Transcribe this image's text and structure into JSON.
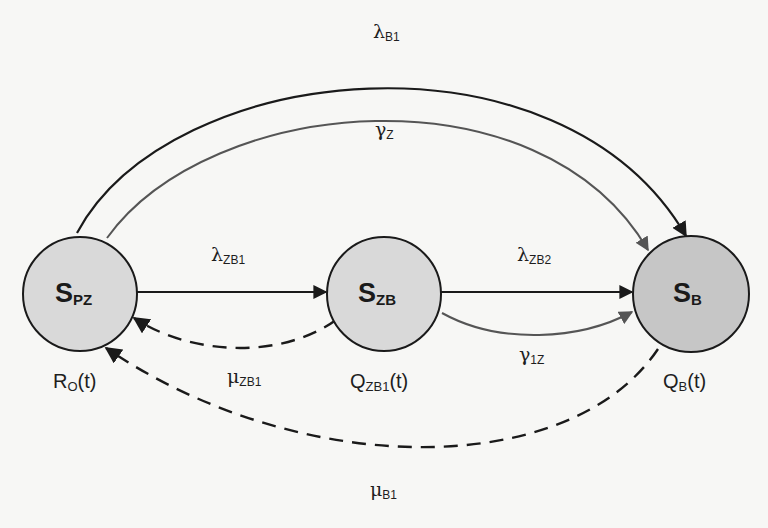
{
  "diagram": {
    "type": "state-transition",
    "nodes": [
      {
        "id": "S_PZ",
        "label_main": "S",
        "label_sub": "PZ",
        "function_main": "R",
        "function_sub": "O",
        "function_arg": "(t)",
        "fill": "#d9d9d9"
      },
      {
        "id": "S_ZB",
        "label_main": "S",
        "label_sub": "ZB",
        "function_main": "Q",
        "function_sub": "ZB1",
        "function_arg": "(t)",
        "fill": "#d9d9d9"
      },
      {
        "id": "S_B",
        "label_main": "S",
        "label_sub": "B",
        "function_main": "Q",
        "function_sub": "B",
        "function_arg": "(t)",
        "fill": "#c6c6c6"
      }
    ],
    "edges": [
      {
        "id": "lambda_B1",
        "from": "S_PZ",
        "to": "S_B",
        "style": "solid",
        "color": "#1a1a1a",
        "symbol": "λ",
        "sub": "B1"
      },
      {
        "id": "gamma_Z",
        "from": "S_PZ",
        "to": "S_B",
        "style": "solid",
        "color": "#555555",
        "symbol": "γ",
        "sub": "Z"
      },
      {
        "id": "lambda_ZB1",
        "from": "S_PZ",
        "to": "S_ZB",
        "style": "solid",
        "color": "#1a1a1a",
        "symbol": "λ",
        "sub": "ZB1"
      },
      {
        "id": "lambda_ZB2",
        "from": "S_ZB",
        "to": "S_B",
        "style": "solid",
        "color": "#1a1a1a",
        "symbol": "λ",
        "sub": "ZB2"
      },
      {
        "id": "gamma_1Z",
        "from": "S_ZB",
        "to": "S_B",
        "style": "solid",
        "color": "#555555",
        "symbol": "γ",
        "sub": "1Z"
      },
      {
        "id": "mu_ZB1",
        "from": "S_ZB",
        "to": "S_PZ",
        "style": "dashed",
        "color": "#1a1a1a",
        "symbol": "μ",
        "sub": "ZB1"
      },
      {
        "id": "mu_B1",
        "from": "S_B",
        "to": "S_PZ",
        "style": "dashed",
        "color": "#1a1a1a",
        "symbol": "μ",
        "sub": "B1"
      }
    ]
  }
}
